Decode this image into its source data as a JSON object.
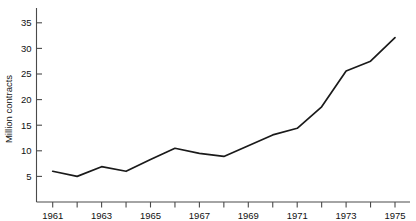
{
  "chart_data": {
    "type": "line",
    "title": "",
    "subtitle": "",
    "xlabel": "",
    "ylabel": "Million contracts",
    "x": [
      1961,
      1962,
      1963,
      1964,
      1965,
      1966,
      1967,
      1968,
      1969,
      1970,
      1971,
      1972,
      1973,
      1974,
      1975
    ],
    "values": [
      6.0,
      5.0,
      6.9,
      6.0,
      8.3,
      10.5,
      9.5,
      8.9,
      11.0,
      13.1,
      14.4,
      18.6,
      25.6,
      27.5,
      32.1
    ],
    "series": [
      {
        "name": "Million contracts",
        "values": [
          6.0,
          5.0,
          6.9,
          6.0,
          8.3,
          10.5,
          9.5,
          8.9,
          11.0,
          13.1,
          14.4,
          18.6,
          25.6,
          27.5,
          32.1
        ]
      }
    ],
    "xlim": [
      1960.5,
      1975.6
    ],
    "ylim": [
      0,
      37.5
    ],
    "xticks": [
      1961,
      1962,
      1963,
      1964,
      1965,
      1966,
      1967,
      1968,
      1969,
      1970,
      1971,
      1972,
      1973,
      1974,
      1975
    ],
    "xticklabels": [
      "1961",
      "",
      "1963",
      "",
      "1965",
      "",
      "1967",
      "",
      "1969",
      "",
      "1971",
      "",
      "1973",
      "",
      "1975"
    ],
    "yticks": [
      5,
      10,
      15,
      20,
      25,
      30,
      35
    ],
    "yticklabels": [
      "5",
      "10",
      "15",
      "20",
      "25",
      "30",
      "35"
    ],
    "grid": false,
    "legend": false,
    "legend_position": "none",
    "line_color": "#1a1a1a",
    "axis_color": "#4a4a4a",
    "background_color": "#ffffff"
  }
}
